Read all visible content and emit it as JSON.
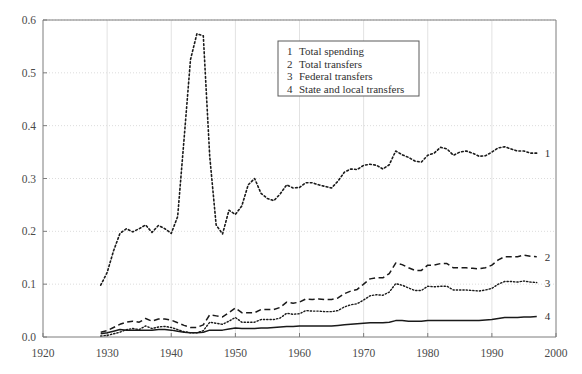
{
  "chart_data": {
    "type": "line",
    "title": "",
    "subtitle": "",
    "xlabel": "",
    "ylabel": "",
    "xlim": [
      1920,
      2000
    ],
    "ylim": [
      0.0,
      0.6
    ],
    "grid": true,
    "legend_position": "top-center-right",
    "x_ticks": [
      "1920",
      "1930",
      "1940",
      "1950",
      "1960",
      "1970",
      "1980",
      "1990",
      "2000"
    ],
    "x_tick_values": [
      1920,
      1930,
      1940,
      1950,
      1960,
      1970,
      1980,
      1990,
      2000
    ],
    "y_ticks": [
      "0.0",
      "0.1",
      "0.2",
      "0.3",
      "0.4",
      "0.5",
      "0.6"
    ],
    "y_tick_values": [
      0.0,
      0.1,
      0.2,
      0.3,
      0.4,
      0.5,
      0.6
    ],
    "legend": [
      {
        "num": "1",
        "label": "Total spending"
      },
      {
        "num": "2",
        "label": "Total transfers"
      },
      {
        "num": "3",
        "label": "Federal transfers"
      },
      {
        "num": "4",
        "label": "State and local transfers"
      }
    ],
    "end_labels": [
      "1",
      "2",
      "3",
      "4"
    ],
    "series": [
      {
        "name": "Total spending",
        "num": "1",
        "style": "dotted",
        "x": [
          1929,
          1930,
          1931,
          1932,
          1933,
          1934,
          1935,
          1936,
          1937,
          1938,
          1939,
          1940,
          1941,
          1942,
          1943,
          1944,
          1945,
          1946,
          1947,
          1948,
          1949,
          1950,
          1951,
          1952,
          1953,
          1954,
          1955,
          1956,
          1957,
          1958,
          1959,
          1960,
          1961,
          1962,
          1963,
          1964,
          1965,
          1966,
          1967,
          1968,
          1969,
          1970,
          1971,
          1972,
          1973,
          1974,
          1975,
          1976,
          1977,
          1978,
          1979,
          1980,
          1981,
          1982,
          1983,
          1984,
          1985,
          1986,
          1987,
          1988,
          1989,
          1990,
          1991,
          1992,
          1993,
          1994,
          1995,
          1996,
          1997
        ],
        "values": [
          0.098,
          0.122,
          0.163,
          0.196,
          0.205,
          0.199,
          0.205,
          0.212,
          0.198,
          0.211,
          0.205,
          0.196,
          0.228,
          0.375,
          0.525,
          0.574,
          0.57,
          0.342,
          0.212,
          0.195,
          0.24,
          0.232,
          0.248,
          0.288,
          0.3,
          0.272,
          0.262,
          0.258,
          0.271,
          0.288,
          0.282,
          0.283,
          0.292,
          0.292,
          0.288,
          0.285,
          0.282,
          0.295,
          0.312,
          0.318,
          0.317,
          0.325,
          0.327,
          0.325,
          0.318,
          0.326,
          0.352,
          0.345,
          0.34,
          0.333,
          0.331,
          0.344,
          0.348,
          0.359,
          0.356,
          0.344,
          0.35,
          0.352,
          0.348,
          0.342,
          0.343,
          0.35,
          0.358,
          0.36,
          0.356,
          0.352,
          0.352,
          0.348,
          0.348
        ]
      },
      {
        "name": "Total transfers",
        "num": "2",
        "style": "dashed",
        "x": [
          1929,
          1930,
          1931,
          1932,
          1933,
          1934,
          1935,
          1936,
          1937,
          1938,
          1939,
          1940,
          1941,
          1942,
          1943,
          1944,
          1945,
          1946,
          1947,
          1948,
          1949,
          1950,
          1951,
          1952,
          1953,
          1954,
          1955,
          1956,
          1957,
          1958,
          1959,
          1960,
          1961,
          1962,
          1963,
          1964,
          1965,
          1966,
          1967,
          1968,
          1969,
          1970,
          1971,
          1972,
          1973,
          1974,
          1975,
          1976,
          1977,
          1978,
          1979,
          1980,
          1981,
          1982,
          1983,
          1984,
          1985,
          1986,
          1987,
          1988,
          1989,
          1990,
          1991,
          1992,
          1993,
          1994,
          1995,
          1996,
          1997
        ],
        "values": [
          0.009,
          0.012,
          0.018,
          0.024,
          0.028,
          0.03,
          0.028,
          0.035,
          0.03,
          0.034,
          0.034,
          0.032,
          0.027,
          0.022,
          0.018,
          0.018,
          0.023,
          0.042,
          0.04,
          0.038,
          0.046,
          0.055,
          0.046,
          0.046,
          0.046,
          0.052,
          0.052,
          0.052,
          0.056,
          0.066,
          0.064,
          0.066,
          0.072,
          0.071,
          0.072,
          0.071,
          0.071,
          0.074,
          0.082,
          0.087,
          0.09,
          0.1,
          0.11,
          0.112,
          0.112,
          0.12,
          0.14,
          0.137,
          0.131,
          0.126,
          0.126,
          0.136,
          0.136,
          0.139,
          0.139,
          0.131,
          0.131,
          0.131,
          0.13,
          0.129,
          0.131,
          0.136,
          0.146,
          0.152,
          0.152,
          0.152,
          0.155,
          0.153,
          0.152
        ],
        "values_note": "ends near 0.14"
      },
      {
        "name": "Federal transfers",
        "num": "3",
        "style": "fine-dotted",
        "x": [
          1929,
          1930,
          1931,
          1932,
          1933,
          1934,
          1935,
          1936,
          1937,
          1938,
          1939,
          1940,
          1941,
          1942,
          1943,
          1944,
          1945,
          1946,
          1947,
          1948,
          1949,
          1950,
          1951,
          1952,
          1953,
          1954,
          1955,
          1956,
          1957,
          1958,
          1959,
          1960,
          1961,
          1962,
          1963,
          1964,
          1965,
          1966,
          1967,
          1968,
          1969,
          1970,
          1971,
          1972,
          1973,
          1974,
          1975,
          1976,
          1977,
          1978,
          1979,
          1980,
          1981,
          1982,
          1983,
          1984,
          1985,
          1986,
          1987,
          1988,
          1989,
          1990,
          1991,
          1992,
          1993,
          1994,
          1995,
          1996,
          1997
        ],
        "values": [
          0.002,
          0.003,
          0.006,
          0.009,
          0.014,
          0.016,
          0.014,
          0.021,
          0.016,
          0.019,
          0.02,
          0.018,
          0.014,
          0.01,
          0.008,
          0.008,
          0.012,
          0.028,
          0.026,
          0.024,
          0.03,
          0.037,
          0.028,
          0.028,
          0.028,
          0.033,
          0.033,
          0.033,
          0.036,
          0.045,
          0.043,
          0.044,
          0.05,
          0.049,
          0.049,
          0.048,
          0.048,
          0.05,
          0.057,
          0.061,
          0.063,
          0.07,
          0.078,
          0.08,
          0.079,
          0.085,
          0.101,
          0.098,
          0.093,
          0.088,
          0.088,
          0.096,
          0.095,
          0.096,
          0.096,
          0.089,
          0.089,
          0.089,
          0.088,
          0.087,
          0.089,
          0.092,
          0.1,
          0.105,
          0.105,
          0.104,
          0.106,
          0.104,
          0.103
        ]
      },
      {
        "name": "State and local transfers",
        "num": "4",
        "style": "solid",
        "x": [
          1929,
          1930,
          1931,
          1932,
          1933,
          1934,
          1935,
          1936,
          1937,
          1938,
          1939,
          1940,
          1941,
          1942,
          1943,
          1944,
          1945,
          1946,
          1947,
          1948,
          1949,
          1950,
          1951,
          1952,
          1953,
          1954,
          1955,
          1956,
          1957,
          1958,
          1959,
          1960,
          1961,
          1962,
          1963,
          1964,
          1965,
          1966,
          1967,
          1968,
          1969,
          1970,
          1971,
          1972,
          1973,
          1974,
          1975,
          1976,
          1977,
          1978,
          1979,
          1980,
          1981,
          1982,
          1983,
          1984,
          1985,
          1986,
          1987,
          1988,
          1989,
          1990,
          1991,
          1992,
          1993,
          1994,
          1995,
          1996,
          1997
        ],
        "values": [
          0.006,
          0.008,
          0.011,
          0.014,
          0.013,
          0.013,
          0.013,
          0.013,
          0.013,
          0.014,
          0.014,
          0.013,
          0.011,
          0.009,
          0.008,
          0.008,
          0.009,
          0.013,
          0.013,
          0.013,
          0.015,
          0.017,
          0.016,
          0.016,
          0.016,
          0.017,
          0.017,
          0.018,
          0.019,
          0.02,
          0.02,
          0.021,
          0.021,
          0.021,
          0.021,
          0.021,
          0.021,
          0.022,
          0.023,
          0.024,
          0.025,
          0.026,
          0.027,
          0.027,
          0.027,
          0.028,
          0.031,
          0.031,
          0.03,
          0.03,
          0.03,
          0.031,
          0.031,
          0.031,
          0.031,
          0.031,
          0.031,
          0.031,
          0.031,
          0.031,
          0.032,
          0.033,
          0.035,
          0.037,
          0.037,
          0.037,
          0.038,
          0.038,
          0.039
        ]
      }
    ]
  }
}
